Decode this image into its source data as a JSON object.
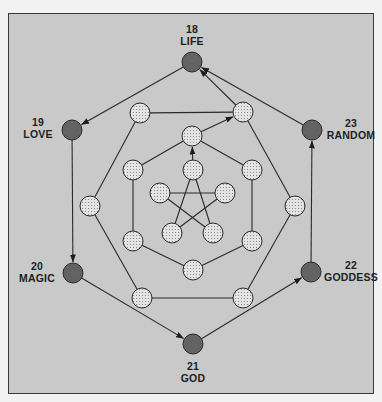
{
  "diagram": {
    "colors": {
      "background": "#c9c9c9",
      "frame_border": "#3a3a3a",
      "line": "#2a2a2a",
      "dark_node_fill": "#6a6a6a",
      "light_node_fill": "#e4e4e4"
    },
    "outer_nodes": [
      {
        "id": "life",
        "number": "18",
        "label": "LIFE",
        "x": 192,
        "y": 62
      },
      {
        "id": "love",
        "number": "19",
        "label": "LOVE",
        "x": 72,
        "y": 130
      },
      {
        "id": "magic",
        "number": "20",
        "label": "MAGIC",
        "x": 73,
        "y": 273
      },
      {
        "id": "god",
        "number": "21",
        "label": "GOD",
        "x": 193,
        "y": 344
      },
      {
        "id": "goddess",
        "number": "22",
        "label": "GODDESS",
        "x": 311,
        "y": 272
      },
      {
        "id": "random",
        "number": "23",
        "label": "RANDOM",
        "x": 312,
        "y": 130
      }
    ],
    "outer_hexagon": [
      {
        "id": "a1",
        "x": 140,
        "y": 113
      },
      {
        "id": "a2",
        "x": 243,
        "y": 112
      },
      {
        "id": "a3",
        "x": 295,
        "y": 206
      },
      {
        "id": "a4",
        "x": 243,
        "y": 298
      },
      {
        "id": "a5",
        "x": 142,
        "y": 298
      },
      {
        "id": "a6",
        "x": 90,
        "y": 206
      }
    ],
    "middle_hexagon": [
      {
        "id": "b1",
        "x": 192,
        "y": 136
      },
      {
        "id": "b2",
        "x": 252,
        "y": 170
      },
      {
        "id": "b3",
        "x": 252,
        "y": 241
      },
      {
        "id": "b4",
        "x": 193,
        "y": 270
      },
      {
        "id": "b5",
        "x": 133,
        "y": 241
      },
      {
        "id": "b6",
        "x": 133,
        "y": 170
      }
    ],
    "pentagram": [
      {
        "id": "c1",
        "x": 193,
        "y": 170
      },
      {
        "id": "c2",
        "x": 225,
        "y": 193
      },
      {
        "id": "c3",
        "x": 213,
        "y": 233
      },
      {
        "id": "c4",
        "x": 172,
        "y": 233
      },
      {
        "id": "c5",
        "x": 160,
        "y": 193
      }
    ],
    "edges": [
      [
        "a1",
        "a2"
      ],
      [
        "a2",
        "a3"
      ],
      [
        "a3",
        "a4"
      ],
      [
        "a4",
        "a5"
      ],
      [
        "a5",
        "a6"
      ],
      [
        "a6",
        "a1"
      ],
      [
        "b1",
        "b2"
      ],
      [
        "b2",
        "b3"
      ],
      [
        "b3",
        "b4"
      ],
      [
        "b4",
        "b5"
      ],
      [
        "b5",
        "b6"
      ],
      [
        "b6",
        "b1"
      ],
      [
        "c1",
        "c3"
      ],
      [
        "c3",
        "c5"
      ],
      [
        "c5",
        "c2"
      ],
      [
        "c2",
        "c4"
      ],
      [
        "c4",
        "c1"
      ]
    ],
    "arrows": [
      [
        "c1",
        "b1"
      ],
      [
        "b1",
        "a2"
      ],
      [
        "a2",
        "life"
      ],
      [
        "random",
        "life"
      ],
      [
        "life",
        "love"
      ],
      [
        "love",
        "magic"
      ],
      [
        "magic",
        "god"
      ],
      [
        "god",
        "goddess"
      ],
      [
        "goddess",
        "random"
      ]
    ]
  }
}
